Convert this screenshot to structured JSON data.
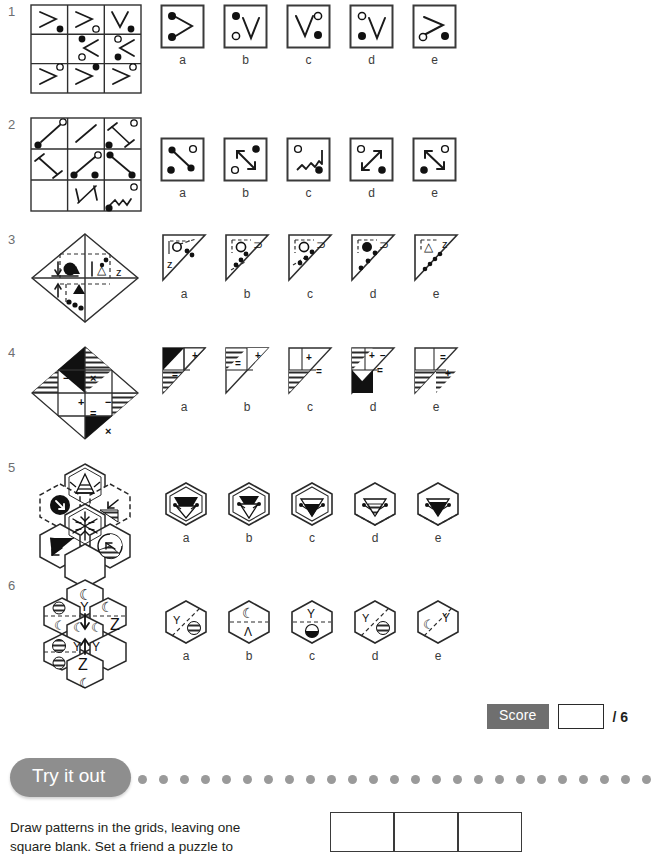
{
  "worksheet": {
    "title_visible": false,
    "questions": [
      {
        "number": "1",
        "stem_type": "3x3-grid",
        "missing_cell": "middle-left",
        "cells": [
          {
            "shape": "greater-than",
            "dot": "filled",
            "dot_pos": "bottom-right"
          },
          {
            "shape": "greater-than",
            "dot": "open",
            "dot_pos": "bottom-right"
          },
          {
            "shape": "vee",
            "dot": "filled",
            "dot_pos": "bottom-right"
          },
          {
            "shape": "empty",
            "dot": "none",
            "dot_pos": "none"
          },
          {
            "shape": "less-than",
            "dot": "filled-top-open-bottom",
            "dot_pos": "left"
          },
          {
            "shape": "less-than",
            "dot": "open-top-filled-bottom",
            "dot_pos": "left"
          },
          {
            "shape": "greater-than",
            "dot": "open",
            "dot_pos": "top-right"
          },
          {
            "shape": "greater-than",
            "dot": "filled",
            "dot_pos": "top-right"
          },
          {
            "shape": "greater-than",
            "dot": "open",
            "dot_pos": "top-right"
          }
        ],
        "options": [
          {
            "label": "a",
            "shape": "greater-than",
            "dots": "filled-top filled-bottom left"
          },
          {
            "label": "b",
            "shape": "vee",
            "dots": "filled-top-left open-bottom-left"
          },
          {
            "label": "c",
            "shape": "vee",
            "dots": "open-top-right filled-bottom-right"
          },
          {
            "label": "d",
            "shape": "vee",
            "dots": "open-top-left filled-bottom-left"
          },
          {
            "label": "e",
            "shape": "greater-than",
            "dots": "open-bottom-left filled-bottom-right"
          }
        ]
      },
      {
        "number": "2",
        "stem_type": "3x3-grid",
        "missing_cell": "bottom-left",
        "cells": [
          {
            "shape": "diag-line",
            "dots": "open-top-right filled-bottom-left"
          },
          {
            "shape": "diag-line",
            "dots": "none"
          },
          {
            "shape": "barbell-diag",
            "dots": "open-top-right filled-bottom-left"
          },
          {
            "shape": "barbell-diag",
            "dots": "none"
          },
          {
            "shape": "dumbbell",
            "dots": "open-top-right filled-bottom-left"
          },
          {
            "shape": "dumbbell",
            "dots": "none"
          },
          {
            "shape": "empty",
            "dots": "none"
          },
          {
            "shape": "double-arrow",
            "dots": "none"
          },
          {
            "shape": "zigzag",
            "dots": "open-top-right filled-bottom-left"
          }
        ],
        "options": [
          {
            "label": "a",
            "shape": "dumbbell",
            "dots": "open-top-right filled-bottom-left"
          },
          {
            "label": "b",
            "shape": "double-arrow",
            "dots": "filled-top-right open-bottom-left"
          },
          {
            "label": "c",
            "shape": "zigzag",
            "dots": "open-top-left filled-bottom-right"
          },
          {
            "label": "d",
            "shape": "double-arrow",
            "dots": "open-top-left filled-bottom-right"
          },
          {
            "label": "e",
            "shape": "double-arrow",
            "dots": "open-top-right filled-bottom-left"
          }
        ]
      },
      {
        "number": "3",
        "stem_type": "diamond",
        "missing_cell": "right",
        "symbols": [
          "down-arrow",
          "filled-circle",
          "triangle-outline",
          "letter-z",
          "up-arrow",
          "filled-triangle",
          "dot-chain"
        ],
        "options": [
          {
            "label": "a",
            "symbols": "open-circle, letter-z, 2 dots, solid edge"
          },
          {
            "label": "b",
            "symbols": "open-circle, letter-s, 3 dots, dashed edge"
          },
          {
            "label": "c",
            "symbols": "open-circle, letter-s, 3 dots, dashed edge"
          },
          {
            "label": "d",
            "symbols": "filled-circle, letter-s, 3 dots, solid edge"
          },
          {
            "label": "e",
            "symbols": "triangle, letter-z, 4 dots, solid edge"
          }
        ]
      },
      {
        "number": "4",
        "stem_type": "diamond",
        "missing_cell": "bottom-left",
        "symbols": [
          "minus",
          "times",
          "plus",
          "minus",
          "equals",
          "times"
        ],
        "options": [
          {
            "label": "a",
            "symbols": "black-triangle, plus, equals, hatched"
          },
          {
            "label": "b",
            "symbols": "hatched, plus, equals"
          },
          {
            "label": "c",
            "symbols": "plain, plus, equals, hatched"
          },
          {
            "label": "d",
            "symbols": "hatched, plus, minus, equals, black"
          },
          {
            "label": "e",
            "symbols": "equals, plus, hatched"
          }
        ]
      },
      {
        "number": "5",
        "stem_type": "hex-cluster",
        "missing_cell": "bottom-middle",
        "symbols": [
          "fountain",
          "arrow-circle",
          "arrow-hatched",
          "snowflake",
          "black-wedge",
          "hatched-circle"
        ],
        "options": [
          {
            "label": "a",
            "symbols": "funnel, solid border, double outline"
          },
          {
            "label": "b",
            "symbols": "funnel, solid border, double outline"
          },
          {
            "label": "c",
            "symbols": "funnel, solid border"
          },
          {
            "label": "d",
            "symbols": "funnel hatched, dashed bottom border"
          },
          {
            "label": "e",
            "symbols": "funnel, dashed bottom border"
          }
        ]
      },
      {
        "number": "6",
        "stem_type": "hex-cluster",
        "missing_cell": "middle-right",
        "symbols": [
          "moon",
          "crescent",
          "letter-y",
          "letter-z",
          "hatched-circle",
          "down-arrow",
          "up-arrow"
        ],
        "options": [
          {
            "label": "a",
            "symbols": "letter-y, diagonal dash, hatched circle"
          },
          {
            "label": "b",
            "symbols": "moon, horizontal dash, letter-lambda"
          },
          {
            "label": "c",
            "symbols": "letter-y, horizontal dash, half-circle"
          },
          {
            "label": "d",
            "symbols": "letter-y, diagonal dash, hatched circle"
          },
          {
            "label": "e",
            "symbols": "moon, diagonal dash, letter-y"
          }
        ]
      }
    ]
  },
  "score": {
    "label": "Score",
    "value": "",
    "total": "/ 6"
  },
  "tryitout": {
    "banner": "Try it out",
    "dot_count": 24,
    "instructions_line1": "Draw patterns in the grids, leaving one",
    "instructions_line2": "square blank. Set a friend a puzzle to",
    "grid_columns": 3
  }
}
